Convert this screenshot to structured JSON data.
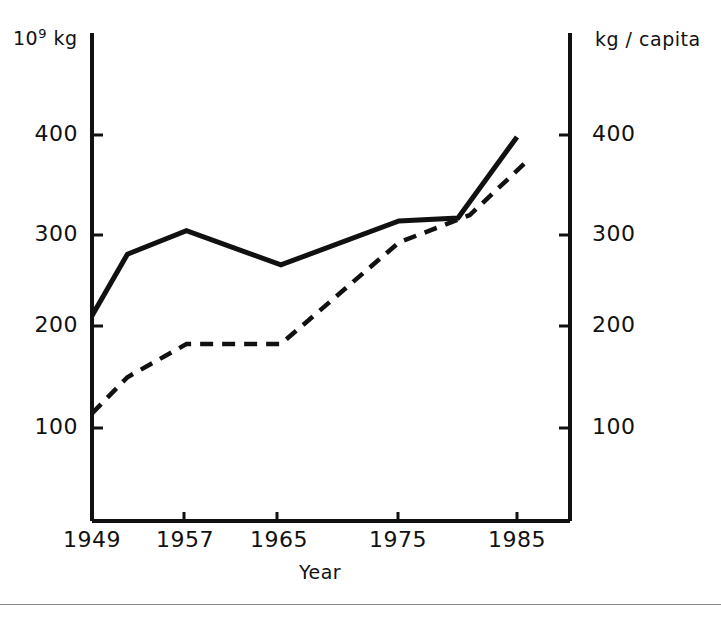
{
  "chart_data": {
    "type": "line",
    "title": "",
    "xlabel": "Year",
    "ylabel_left": "10⁹ kg",
    "ylabel_left_mantissa": "10",
    "ylabel_left_exponent": "9",
    "ylabel_left_unit": "kg",
    "ylabel_right": "kg / capita",
    "x": [
      1949,
      1952,
      1957,
      1965,
      1975,
      1980,
      1985
    ],
    "xlim": [
      1949,
      1990
    ],
    "xticks": [
      1949,
      1957,
      1965,
      1975,
      1985
    ],
    "xticklabels": [
      "1949",
      "1957",
      "1965",
      "1975",
      "1985"
    ],
    "ylim_left": [
      0,
      445
    ],
    "yticks_left": [
      100,
      200,
      300,
      400
    ],
    "yticklabels_left": [
      "100",
      "200",
      "300",
      "400"
    ],
    "ylim_right": [
      0,
      445
    ],
    "yticks_right": [
      100,
      200,
      300,
      400
    ],
    "yticklabels_right": [
      "100",
      "200",
      "300",
      "400"
    ],
    "grid": false,
    "legend": "none",
    "series": [
      {
        "name": "Total production",
        "axis": "left",
        "unit": "10⁹ kg",
        "style": "solid",
        "color": "#111111",
        "x": [
          1949,
          1952,
          1957,
          1965,
          1975,
          1980,
          1985
        ],
        "values": [
          215,
          278,
          302,
          267,
          312,
          315,
          398
        ]
      },
      {
        "name": "Per capita production",
        "axis": "right",
        "unit": "kg / capita",
        "style": "dashed",
        "color": "#111111",
        "x": [
          1949,
          1952,
          1957,
          1965,
          1975,
          1981,
          1986
        ],
        "values": [
          115,
          152,
          186,
          186,
          290,
          318,
          375
        ]
      }
    ]
  },
  "axes": {
    "left_unit_label": "10",
    "left_unit_exponent": "9",
    "left_unit_suffix": "kg",
    "right_unit_label": "kg / capita",
    "x_title": "Year"
  },
  "colors": {
    "ink": "#111111",
    "background": "#ffffff",
    "rule": "#8a8a8a"
  }
}
